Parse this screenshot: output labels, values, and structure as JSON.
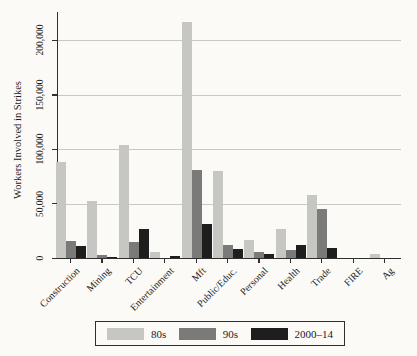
{
  "figure": {
    "background": "#fbfaf7",
    "axis_color": "#2f2f2f",
    "gridline_color": "#c9c8c4",
    "text_color": "#1a1a1a"
  },
  "chart_data": {
    "type": "bar",
    "title": "",
    "xlabel": "",
    "ylabel": "Workers Involved in Strikes",
    "categories": [
      "Construction",
      "Mining",
      "TCU",
      "Entertainment",
      "Mft",
      "Public/Educ.",
      "Personal",
      "Health",
      "Trade",
      "FIRE",
      "Ag"
    ],
    "series": [
      {
        "name": "80s",
        "color": "#c6c6c3",
        "values": [
          88000,
          52000,
          104000,
          5500,
          217000,
          80000,
          17000,
          27000,
          58000,
          0,
          4000
        ]
      },
      {
        "name": "90s",
        "color": "#7a7a78",
        "values": [
          16000,
          3000,
          15000,
          0,
          81000,
          11500,
          5500,
          7000,
          45000,
          0,
          0
        ]
      },
      {
        "name": "2000–14",
        "color": "#1e1e1e",
        "values": [
          11000,
          800,
          27000,
          1500,
          31000,
          8500,
          3500,
          11500,
          9000,
          0,
          0
        ]
      }
    ],
    "ylim": [
      0,
      226000
    ],
    "yticks": [
      0,
      50000,
      100000,
      150000,
      200000
    ],
    "ytick_labels": [
      "0",
      "50,000",
      "100,000",
      "150,000",
      "200,000"
    ],
    "grid": true,
    "legend_position": "bottom-center"
  }
}
